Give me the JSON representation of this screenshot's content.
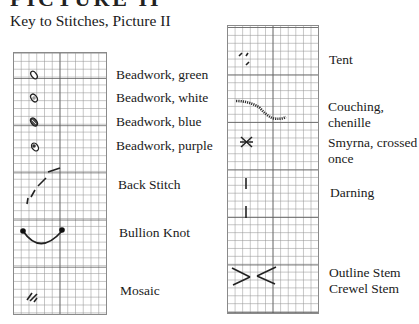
{
  "page": {
    "heading": "PICTURE II",
    "subtitle": "Key to Stitches, Picture II"
  },
  "key_left": [
    {
      "label": "Beadwork, green",
      "icon": "bead-icon"
    },
    {
      "label": "Beadwork, white",
      "icon": "bead-icon"
    },
    {
      "label": "Beadwork, blue",
      "icon": "bead-icon"
    },
    {
      "label": "Beadwork, purple",
      "icon": "bead-icon"
    },
    {
      "label": "Back Stitch",
      "icon": "back-stitch-icon"
    },
    {
      "label": "Bullion Knot",
      "icon": "bullion-knot-icon"
    },
    {
      "label": "Mosaic",
      "icon": "mosaic-stitch-icon"
    }
  ],
  "key_right": [
    {
      "label": "Tent",
      "icon": "tent-stitch-icon"
    },
    {
      "label": "Couching,",
      "label2": "chenille",
      "icon": "couching-icon"
    },
    {
      "label": "Smyrna, crossed",
      "label2": "once",
      "icon": "smyrna-cross-icon"
    },
    {
      "label": "Darning",
      "icon": "darning-stitch-icon"
    },
    {
      "label": "Outline Stem",
      "label2": "Crewel Stem",
      "icon": "stem-stitch-icon"
    }
  ]
}
